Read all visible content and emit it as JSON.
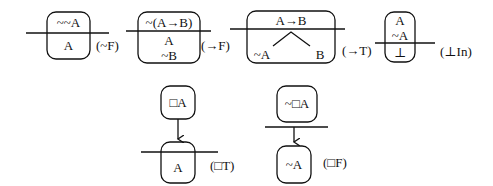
{
  "rules": [
    {
      "id": "neg-F",
      "label": "(~F)",
      "above": [
        "~~A"
      ],
      "below": [
        "A"
      ]
    },
    {
      "id": "arrow-F",
      "label": "(→F)",
      "above": [
        "~(A→B)"
      ],
      "below": [
        "A",
        "~B"
      ]
    },
    {
      "id": "arrow-T",
      "label": "(→T)",
      "above": [
        "A→B"
      ],
      "below_branches": [
        "~A",
        "B"
      ]
    },
    {
      "id": "bottom-In",
      "label": "(⊥In)",
      "above": [
        "A",
        "~A"
      ],
      "below": [
        "⊥"
      ]
    },
    {
      "id": "box-T",
      "label": "(□T)",
      "top_world": "□A",
      "bottom_world": "A"
    },
    {
      "id": "box-F",
      "label": "(□F)",
      "top_world": "~□A",
      "bottom_world": "~A"
    }
  ],
  "colors": {
    "stroke": "#111111",
    "background": "#ffffff"
  }
}
